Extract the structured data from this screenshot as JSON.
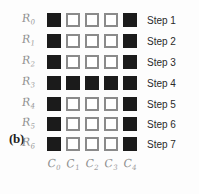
{
  "figure": {
    "panel_label": "(b)",
    "background_color": "#fdfdfd",
    "filled_color": "#1b1b1b",
    "empty_border_color": "#8a8a8a",
    "handwriting_color": "#8e8e8e",
    "step_text_color": "#2a2a2a"
  },
  "chart_data": {
    "type": "heatmap",
    "title": "",
    "xlabel": "",
    "ylabel": "",
    "row_labels": [
      "R0",
      "R1",
      "R2",
      "R3",
      "R4",
      "R5",
      "R6"
    ],
    "column_labels": [
      "C0",
      "C1",
      "C2",
      "C3",
      "C4"
    ],
    "step_labels": [
      "Step 1",
      "Step 2",
      "Step 3",
      "Step 4",
      "Step 5",
      "Step 6",
      "Step 7"
    ],
    "legend": "filled = 1 (black), empty = 0 (white outline)",
    "values": [
      [
        1,
        0,
        0,
        0,
        1
      ],
      [
        1,
        0,
        0,
        0,
        1
      ],
      [
        1,
        0,
        0,
        0,
        1
      ],
      [
        1,
        1,
        1,
        1,
        1
      ],
      [
        1,
        0,
        0,
        0,
        1
      ],
      [
        1,
        0,
        0,
        0,
        1
      ],
      [
        1,
        0,
        0,
        0,
        1
      ]
    ]
  },
  "rows": [
    {
      "label_base": "R",
      "label_sub": "0",
      "step": "Step 1",
      "cells": [
        1,
        0,
        0,
        0,
        1
      ],
      "top": 10
    },
    {
      "label_base": "R",
      "label_sub": "1",
      "step": "Step 2",
      "cells": [
        1,
        0,
        0,
        0,
        1
      ],
      "top": 31
    },
    {
      "label_base": "R",
      "label_sub": "2",
      "step": "Step 3",
      "cells": [
        1,
        0,
        0,
        0,
        1
      ],
      "top": 52
    },
    {
      "label_base": "R",
      "label_sub": "3",
      "step": "Step 4",
      "cells": [
        1,
        1,
        1,
        1,
        1
      ],
      "top": 73
    },
    {
      "label_base": "R",
      "label_sub": "4",
      "step": "Step 5",
      "cells": [
        1,
        0,
        0,
        0,
        1
      ],
      "top": 94
    },
    {
      "label_base": "R",
      "label_sub": "5",
      "step": "Step 6",
      "cells": [
        1,
        0,
        0,
        0,
        1
      ],
      "top": 114
    },
    {
      "label_base": "R",
      "label_sub": "6",
      "step": "Step 7",
      "cells": [
        1,
        0,
        0,
        0,
        1
      ],
      "top": 134
    }
  ],
  "columns": [
    {
      "label_base": "C",
      "label_sub": "0"
    },
    {
      "label_base": "C",
      "label_sub": "1"
    },
    {
      "label_base": "C",
      "label_sub": "2"
    },
    {
      "label_base": "C",
      "label_sub": "3"
    },
    {
      "label_base": "C",
      "label_sub": "4"
    }
  ]
}
